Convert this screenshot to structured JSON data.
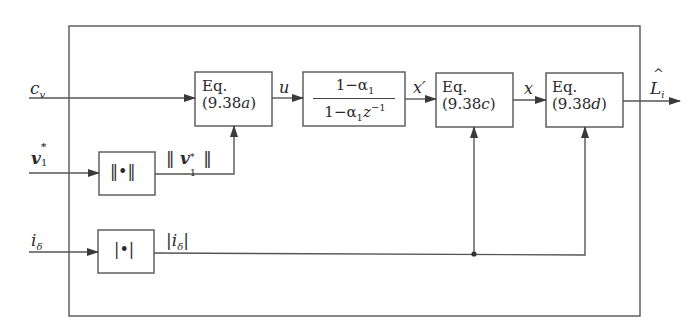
{
  "diagram": {
    "type": "block-diagram",
    "inputs": {
      "c_v": "c",
      "c_v_sub": "v",
      "v1_star": "v",
      "v1_star_sub": "1",
      "v1_star_sup": "*",
      "i_delta": "i",
      "i_delta_sub": "δ"
    },
    "blocks": {
      "eq_a": {
        "line1": "Eq.",
        "line2": "(9.38",
        "tag": "a",
        "close": ")"
      },
      "filter": {
        "numerator": "1−α",
        "numerator_sub": "1",
        "denominator": "1−α",
        "denominator_sub": "1",
        "denominator_z": "z",
        "denominator_exp": "−1"
      },
      "eq_c": {
        "line1": "Eq.",
        "line2": "(9.38",
        "tag": "c",
        "close": ")"
      },
      "eq_d": {
        "line1": "Eq.",
        "line2": "(9.38",
        "tag": "d",
        "close": ")"
      },
      "norm": {
        "label": "‖•‖"
      },
      "abs": {
        "label": "|•|"
      }
    },
    "signals": {
      "u": "u",
      "x_prime": "x′",
      "x": "x",
      "norm_out_open": "‖",
      "norm_out_var": "v",
      "norm_out_sub": "1",
      "norm_out_sup": "*",
      "norm_out_close": "‖",
      "abs_out_open": "|",
      "abs_out_var": "i",
      "abs_out_sub": "δ",
      "abs_out_close": "|",
      "output": "L",
      "output_hat": "^",
      "output_sub": "i"
    },
    "colors": {
      "line": "#4a4a4a",
      "text": "#2a2a2a",
      "background": "#ffffff"
    }
  }
}
